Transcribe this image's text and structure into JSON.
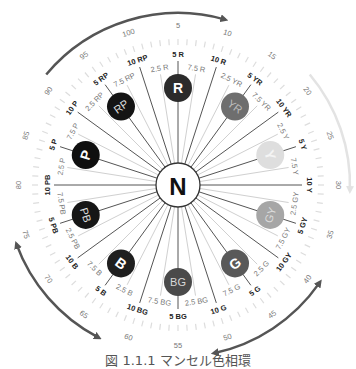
{
  "diagram": {
    "center": {
      "label": "N",
      "x": 178,
      "y": 185,
      "radius": 22
    },
    "hue_circle_radius": 97,
    "hue_circle_size": 14,
    "major_label_radius": 131,
    "number_label_radius": 160,
    "minor_label_radius": 118,
    "colors": {
      "line_major": "#555555",
      "line_minor": "#d0d0d0",
      "tick": "#dddddd",
      "arrow_dark": "#555555",
      "arrow_light": "#e3e3e3",
      "text_major": "#222222",
      "text_minor": "#777777"
    },
    "hues": [
      {
        "name": "R",
        "label": "R",
        "major": "5 R",
        "number": "5",
        "prev_minor": "2.5 R",
        "next_minor": "7.5 R",
        "boundary": "10 R",
        "boundary_number": "10",
        "fill": "#2b2b2b",
        "text": "#ffffff"
      },
      {
        "name": "YR",
        "label": "YR",
        "major": "5 YR",
        "number": "15",
        "prev_minor": "2.5 YR",
        "next_minor": "7.5 YR",
        "boundary": "10 YR",
        "boundary_number": "20",
        "fill": "#6e6e6e",
        "text": "#bdbdbd"
      },
      {
        "name": "Y",
        "label": "Y",
        "major": "5 Y",
        "number": "25",
        "prev_minor": "2.5 Y",
        "next_minor": "7.5 Y",
        "boundary": "10 Y",
        "boundary_number": "30",
        "fill": "#dedede",
        "text": "#f4f4f4"
      },
      {
        "name": "GY",
        "label": "GY",
        "major": "5 GY",
        "number": "35",
        "prev_minor": "2.5 GY",
        "next_minor": "7.5 GY",
        "boundary": "10 GY",
        "boundary_number": "40",
        "fill": "#a6a6a6",
        "text": "#dcdcdc"
      },
      {
        "name": "G",
        "label": "G",
        "major": "5 G",
        "number": "45",
        "prev_minor": "2.5 G",
        "next_minor": "7.5 G",
        "boundary": "10 G",
        "boundary_number": "50",
        "fill": "#595959",
        "text": "#ffffff"
      },
      {
        "name": "BG",
        "label": "BG",
        "major": "5 BG",
        "number": "55",
        "prev_minor": "2.5 BG",
        "next_minor": "7.5 BG",
        "boundary": "10 BG",
        "boundary_number": "60",
        "fill": "#4a4a4a",
        "text": "#d8d8d8"
      },
      {
        "name": "B",
        "label": "B",
        "major": "5 B",
        "number": "65",
        "prev_minor": "2.5 B",
        "next_minor": "7.5 B",
        "boundary": "10 B",
        "boundary_number": "70",
        "fill": "#1f1f1f",
        "text": "#ffffff"
      },
      {
        "name": "PB",
        "label": "PB",
        "major": "5 PB",
        "number": "75",
        "prev_minor": "2.5 PB",
        "next_minor": "7.5 PB",
        "boundary": "10 PB",
        "boundary_number": "80",
        "fill": "#161616",
        "text": "#dddddd"
      },
      {
        "name": "P",
        "label": "P",
        "major": "5 P",
        "number": "85",
        "prev_minor": "2.5 P",
        "next_minor": "7.5 P",
        "boundary": "10 P",
        "boundary_number": "90",
        "fill": "#0f0f0f",
        "text": "#ffffff"
      },
      {
        "name": "RP",
        "label": "RP",
        "major": "5 RP",
        "number": "95",
        "prev_minor": "2.5 RP",
        "next_minor": "7.5 RP",
        "boundary": "10 RP",
        "boundary_number": "100",
        "fill": "#141414",
        "text": "#dddddd"
      }
    ],
    "arrows": [
      {
        "name": "arrow-top",
        "from_deg": -50,
        "to_deg": 16,
        "color": "dark",
        "radius": 172,
        "head": "end"
      },
      {
        "name": "arrow-right",
        "from_deg": 50,
        "to_deg": 92,
        "color": "light",
        "radius": 172,
        "head": "end"
      },
      {
        "name": "arrow-bottom-right",
        "from_deg": 125,
        "to_deg": 168,
        "color": "dark",
        "radius": 172,
        "head": "both"
      },
      {
        "name": "arrow-bottom-left",
        "from_deg": 208,
        "to_deg": 250,
        "color": "dark",
        "radius": 172,
        "head": "both"
      }
    ],
    "caption": "図 1.1.1 マンセル色相環"
  }
}
